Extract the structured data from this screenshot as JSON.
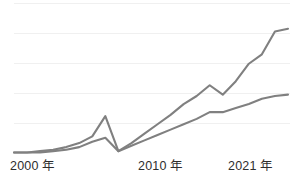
{
  "chart_data": {
    "type": "line",
    "title": "",
    "subtitle": "",
    "xlabel": "",
    "ylabel": "",
    "grid": true,
    "gridlines_count": 5,
    "legend_position": "none",
    "xlim": [
      2000,
      2021
    ],
    "ylim": [
      0,
      100
    ],
    "x": [
      2000,
      2001,
      2002,
      2003,
      2004,
      2005,
      2006,
      2007,
      2008,
      2009,
      2010,
      2011,
      2012,
      2013,
      2014,
      2015,
      2016,
      2017,
      2018,
      2019,
      2020,
      2021
    ],
    "categories": [
      "2000",
      "2001",
      "2002",
      "2003",
      "2004",
      "2005",
      "2006",
      "2007",
      "2008",
      "2009",
      "2010",
      "2011",
      "2012",
      "2013",
      "2014",
      "2015",
      "2016",
      "2017",
      "2018",
      "2019",
      "2020",
      "2021"
    ],
    "series": [
      {
        "name": "upper-series",
        "color": "#808080",
        "values": [
          0,
          0,
          1,
          2,
          4,
          7,
          12,
          27,
          1,
          7,
          14,
          21,
          28,
          36,
          42,
          50,
          43,
          53,
          66,
          73,
          90,
          92
        ]
      },
      {
        "name": "lower-series",
        "color": "#808080",
        "values": [
          0,
          0,
          0,
          1,
          2,
          4,
          8,
          11,
          1,
          5,
          9,
          13,
          17,
          21,
          25,
          30,
          30,
          33,
          36,
          40,
          42,
          43
        ]
      }
    ]
  },
  "axis": {
    "x_tick_labels": [
      {
        "year": "2000",
        "unit": "年",
        "left_px": 10
      },
      {
        "year": "2010",
        "unit": "年",
        "left_px": 138
      },
      {
        "year": "2021",
        "unit": "年",
        "left_px": 228
      }
    ]
  },
  "colors": {
    "background": "#ffffff",
    "gridline": "#f0f0f0",
    "line": "#808080",
    "label_text": "#2e2e2e"
  }
}
